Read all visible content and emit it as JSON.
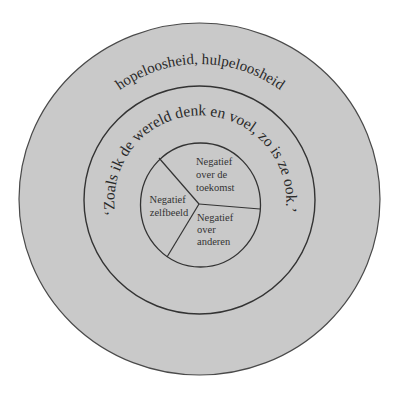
{
  "diagram": {
    "colors": {
      "background": "#ffffff",
      "fill": "#c8c8c8",
      "stroke": "#3a3a3a",
      "text": "#2a2a2a"
    },
    "outer_ring": {
      "label": "hopeloosheid, hulpeloosheid"
    },
    "middle_ring": {
      "label": "‘Zoals ik de wereld denk en voel, zo is ze ook.’"
    },
    "core": {
      "segments": [
        {
          "id": "zelfbeeld",
          "lines": [
            "Negatief",
            "zelfbeeld"
          ]
        },
        {
          "id": "toekomst",
          "lines": [
            "Negatief",
            "over de",
            "toekomst"
          ]
        },
        {
          "id": "anderen",
          "lines": [
            "Negatief",
            "over",
            "anderen"
          ]
        }
      ]
    }
  }
}
